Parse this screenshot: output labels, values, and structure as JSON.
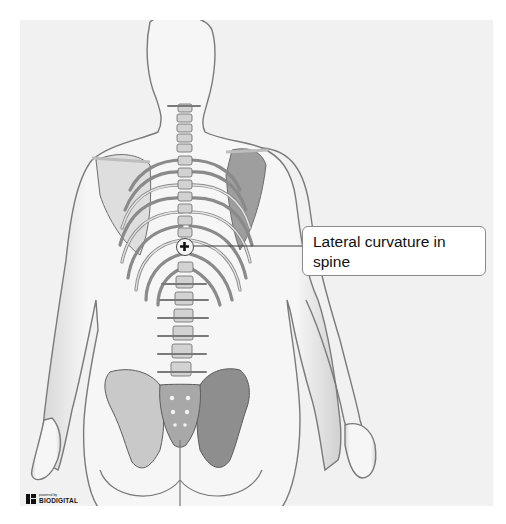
{
  "viewer": {
    "title": "3D anatomy viewer - posterior view",
    "view": "posterior torso with skeleton",
    "background_color": "#f1f1f1"
  },
  "annotation": {
    "marker_icon": "plus-circle-icon",
    "label": "Lateral curvature in spine"
  },
  "branding": {
    "powered_by": "powered by",
    "name": "BIODIGITAL"
  }
}
